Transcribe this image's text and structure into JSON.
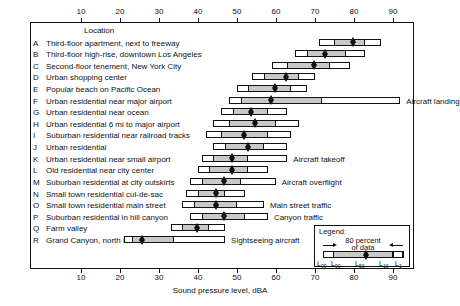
{
  "axis": {
    "title": "Sound pressure level, dBA",
    "ticks": [
      10,
      20,
      30,
      40,
      50,
      60,
      70,
      80,
      90
    ],
    "min": 0,
    "max": 95
  },
  "column_header": "Location",
  "legend": {
    "title": "Legend:",
    "caption_line1": "80 percent",
    "caption_line2": "of data",
    "labels": [
      "L99",
      "L90",
      "L50",
      "L10",
      "L1"
    ]
  },
  "chart_data": {
    "type": "bar",
    "title": "",
    "xlabel": "Sound pressure level, dBA",
    "ylabel": "Location",
    "xlim": [
      0,
      95
    ],
    "grid": false,
    "legend_position": "bottom-right",
    "percentiles": [
      "L99",
      "L90",
      "L50",
      "L10",
      "L1"
    ],
    "categories": [
      "Third-floor apartment, next to freeway",
      "Third-floor high-rise, downtown Los Angeles",
      "Second-floor tenement, New York City",
      "Urban shopping center",
      "Popular beach on Pacific Ocean",
      "Urban residential near major airport",
      "Urban residential near ocean",
      "Urban residential 6 mi to major airport",
      "Suburban residential near railroad tracks",
      "Urban residential",
      "Urban residential near small airport",
      "Old residential near city center",
      "Suburban residential at city outskirts",
      "Small town residential cul-de-sac",
      "Small town residential main street",
      "Suburban residential in hill canyon",
      "Farm valley",
      "Grand Canyon, north rim"
    ],
    "rows": [
      {
        "key": "A",
        "letter": "A",
        "label": "Third-floor apartment, next to freeway",
        "L99": 71,
        "L90": 75,
        "L50": 79,
        "L10": 83,
        "L1": 87,
        "note": ""
      },
      {
        "key": "B",
        "letter": "B",
        "label": "Third-floor high-rise, downtown Los Angeles",
        "L99": 65,
        "L90": 68,
        "L50": 72,
        "L10": 78,
        "L1": 83,
        "note": ""
      },
      {
        "key": "C",
        "letter": "C",
        "label": "Second-floor tenement, New York City",
        "L99": 59,
        "L90": 63,
        "L50": 69,
        "L10": 74,
        "L1": 79,
        "note": ""
      },
      {
        "key": "D",
        "letter": "D",
        "label": "Urban shopping center",
        "L99": 54,
        "L90": 57,
        "L50": 62,
        "L10": 66,
        "L1": 70,
        "note": ""
      },
      {
        "key": "E",
        "letter": "E",
        "label": "Popular beach on Pacific Ocean",
        "L99": 50,
        "L90": 53,
        "L50": 59,
        "L10": 64,
        "L1": 68,
        "note": ""
      },
      {
        "key": "F",
        "letter": "F",
        "label": "Urban residential near major airport",
        "L99": 48,
        "L90": 51,
        "L50": 58,
        "L10": 72,
        "L1": 92,
        "note": "Aircraft landing"
      },
      {
        "key": "G",
        "letter": "G",
        "label": "Urban residential near ocean",
        "L99": 46,
        "L90": 49,
        "L50": 53,
        "L10": 58,
        "L1": 63,
        "note": ""
      },
      {
        "key": "H",
        "letter": "H",
        "label": "Urban residential 6 mi to major airport",
        "L99": 44,
        "L90": 48,
        "L50": 54,
        "L10": 60,
        "L1": 66,
        "note": ""
      },
      {
        "key": "I",
        "letter": "I",
        "label": "Suburban residential near railroad tracks",
        "L99": 42,
        "L90": 46,
        "L50": 51,
        "L10": 58,
        "L1": 64,
        "note": ""
      },
      {
        "key": "J",
        "letter": "J",
        "label": "Urban residential",
        "L99": 44,
        "L90": 47,
        "L50": 52,
        "L10": 57,
        "L1": 63,
        "note": ""
      },
      {
        "key": "K",
        "letter": "K",
        "label": "Urban residential near small airport",
        "L99": 41,
        "L90": 44,
        "L50": 48,
        "L10": 53,
        "L1": 63,
        "note": "Aircraft takeoff"
      },
      {
        "key": "L",
        "letter": "L",
        "label": "Old residential near city center",
        "L99": 40,
        "L90": 43,
        "L50": 48,
        "L10": 53,
        "L1": 58,
        "note": ""
      },
      {
        "key": "M",
        "letter": "M",
        "label": "Suburban residential at city outskirts",
        "L99": 38,
        "L90": 41,
        "L50": 46,
        "L10": 51,
        "L1": 60,
        "note": "Aircraft overflight"
      },
      {
        "key": "N",
        "letter": "N",
        "label": "Small town residential cul-de-sac",
        "L99": 37,
        "L90": 40,
        "L50": 44,
        "L10": 47,
        "L1": 52,
        "note": ""
      },
      {
        "key": "O",
        "letter": "O",
        "label": "Small town residential main street",
        "L99": 36,
        "L90": 39,
        "L50": 44,
        "L10": 50,
        "L1": 57,
        "note": "Main street traffic"
      },
      {
        "key": "P",
        "letter": "P",
        "label": "Suburban residential in hill canyon",
        "L99": 38,
        "L90": 41,
        "L50": 46,
        "L10": 52,
        "L1": 58,
        "note": "Canyon traffic"
      },
      {
        "key": "Q",
        "letter": "Q",
        "label": "Farm valley",
        "L99": 33,
        "L90": 36,
        "L50": 39,
        "L10": 43,
        "L1": 47,
        "note": ""
      },
      {
        "key": "R",
        "letter": "R",
        "label": "Grand Canyon, north rim",
        "L99": 21,
        "L90": 23,
        "L50": 25,
        "L10": 34,
        "L1": 47,
        "note": "Sightseeing aircraft"
      }
    ]
  }
}
